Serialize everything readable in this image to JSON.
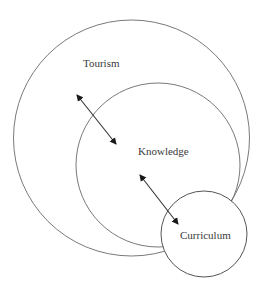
{
  "diagram": {
    "type": "nested-circles",
    "circles": [
      {
        "id": "tourism",
        "label": "Tourism",
        "cx": 131.5,
        "cy": 138,
        "r": 118
      },
      {
        "id": "knowledge",
        "label": "Knowledge",
        "cx": 158,
        "cy": 165,
        "r": 82
      },
      {
        "id": "curriculum",
        "label": "Curriculum",
        "cx": 204,
        "cy": 234,
        "r": 43
      }
    ],
    "labels": {
      "tourism": "Tourism",
      "knowledge": "Knowledge",
      "curriculum": "Curriculum"
    },
    "arrows": [
      {
        "from": "tourism",
        "to": "knowledge",
        "type": "bidirectional"
      },
      {
        "from": "knowledge",
        "to": "curriculum",
        "type": "bidirectional"
      }
    ],
    "colors": {
      "stroke": "#6a6a6a",
      "arrow": "#1a1a1a",
      "text": "#3a3a3a",
      "background": "#ffffff"
    }
  }
}
